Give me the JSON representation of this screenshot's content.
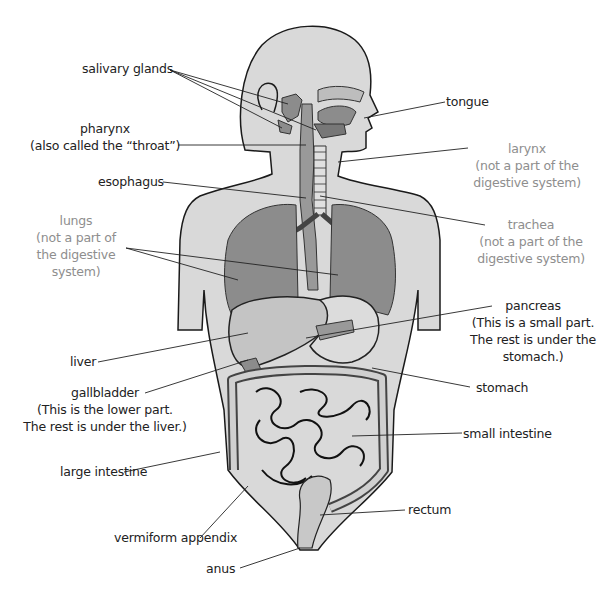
{
  "diagram": {
    "colors": {
      "body_fill": "#d9d9d9",
      "organ_fill": "#8c8c8c",
      "organ_light": "#bdbdbd",
      "outline": "#1a1a1a",
      "label_black": "#222222",
      "label_gray": "#8e8e8e"
    },
    "labels": {
      "salivary_glands": "salivary glands",
      "tongue": "tongue",
      "pharynx": {
        "line1": "pharynx",
        "line2": "(also called the “throat”)"
      },
      "larynx": {
        "line1": "larynx",
        "line2": "(not a part of the",
        "line3": "digestive system)"
      },
      "esophagus": "esophagus",
      "trachea": {
        "line1": "trachea",
        "line2": "(not a part of the",
        "line3": "digestive system)"
      },
      "lungs": {
        "line1": "lungs",
        "line2": "(not a part of",
        "line3": "the digestive",
        "line4": "system)"
      },
      "pancreas": {
        "line1": "pancreas",
        "line2": "(This is a small part.",
        "line3": "The rest is under the",
        "line4": "stomach.)"
      },
      "liver": "liver",
      "stomach": "stomach",
      "gallbladder": {
        "line1": "gallbladder",
        "line2": "(This is the lower part.",
        "line3": "The rest is under the liver.)"
      },
      "small_intestine": "small intestine",
      "large_intestine": "large intestine",
      "rectum": "rectum",
      "vermiform_appendix": "vermiform appendix",
      "anus": "anus"
    }
  }
}
